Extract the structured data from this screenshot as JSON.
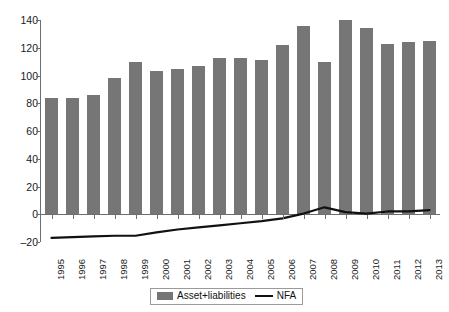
{
  "chart_data": {
    "type": "bar",
    "title": "",
    "subtitle": "",
    "xlabel": "",
    "ylabel": "",
    "ylim": [
      -20,
      140
    ],
    "yticks": [
      -20,
      0,
      20,
      40,
      60,
      80,
      100,
      120,
      140
    ],
    "grid": false,
    "legend_position": "bottom",
    "categories": [
      "1995",
      "1996",
      "1997",
      "1998",
      "1999",
      "2000",
      "2001",
      "2002",
      "2003",
      "2004",
      "2005",
      "2006",
      "2007",
      "2008",
      "2009",
      "2010",
      "2011",
      "2012",
      "2013"
    ],
    "series": [
      {
        "name": "Asset+liabilities",
        "type": "bar",
        "color": "#767676",
        "values": [
          84,
          83.5,
          86,
          98,
          110,
          103,
          105,
          107,
          112.5,
          112.5,
          111,
          122,
          136,
          110,
          140,
          134,
          123,
          124,
          125
        ]
      },
      {
        "name": "NFA",
        "type": "line",
        "color": "#111111",
        "values": [
          -17,
          -16.5,
          -16,
          -15.5,
          -15.5,
          -13,
          -11,
          -9.5,
          -8,
          -6.5,
          -5,
          -3,
          0.5,
          5,
          1.5,
          0.5,
          2,
          2,
          3
        ]
      }
    ]
  },
  "legend": {
    "items": [
      {
        "label": "Asset+liabilities",
        "marker": "bar-swatch-icon"
      },
      {
        "label": "NFA",
        "marker": "line-swatch-icon"
      }
    ]
  },
  "axes": {
    "y_tick_labels": [
      "140",
      "120",
      "100",
      "80",
      "60",
      "40",
      "20",
      "0",
      "-20"
    ],
    "x_tick_labels": [
      "1995",
      "1996",
      "1997",
      "1998",
      "1999",
      "2000",
      "2001",
      "2002",
      "2003",
      "2004",
      "2005",
      "2006",
      "2007",
      "2008",
      "2009",
      "2010",
      "2011",
      "2012",
      "2013"
    ]
  }
}
